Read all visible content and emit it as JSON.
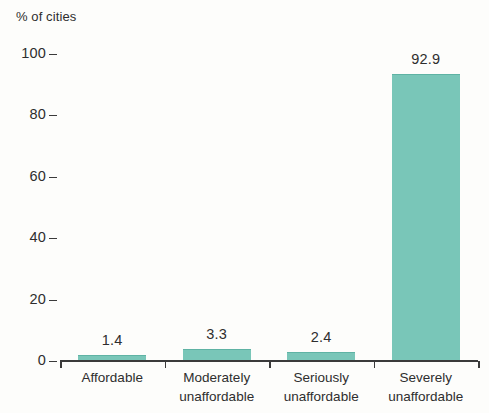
{
  "chart_data": {
    "type": "bar",
    "title": "",
    "subtitle": "",
    "xlabel": "",
    "ylabel": "% of cities",
    "ylim": [
      0,
      100
    ],
    "grid": false,
    "legend": "none",
    "categories": [
      "Affordable",
      "Moderately unaffordable",
      "Seriously unaffordable",
      "Severely unaffordable"
    ],
    "category_lines": [
      [
        "Affordable",
        ""
      ],
      [
        "Moderately",
        "unaffordable"
      ],
      [
        "Seriously",
        "unaffordable"
      ],
      [
        "Severely",
        "unaffordable"
      ]
    ],
    "values": [
      1.4,
      3.3,
      2.4,
      92.9
    ],
    "data_labels": [
      "1.4",
      "3.3",
      "2.4",
      "92.9"
    ],
    "y_ticks": [
      100,
      80,
      60,
      40,
      20,
      0
    ],
    "y_tick_labels": [
      "100",
      "80",
      "60",
      "40",
      "20",
      "0"
    ],
    "bar_color": "#79c6b8",
    "axis_color": "#3a3a3a",
    "text_color": "#2e2e2e",
    "background_color": "#fdfdfb"
  }
}
